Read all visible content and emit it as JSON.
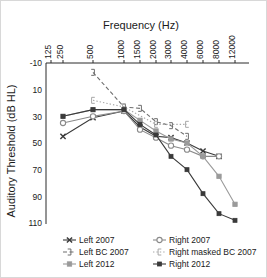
{
  "chart_data": {
    "type": "line",
    "title": "Frequency (Hz)",
    "xlabel": "Frequency (Hz)",
    "ylabel": "Auditory Threshold (dB HL)",
    "x_tick_labels": [
      "125",
      "250",
      "500",
      "1000",
      "1500",
      "2000",
      "3000",
      "4000",
      "6000",
      "8000",
      "12000"
    ],
    "x_values": [
      125,
      250,
      500,
      1000,
      1500,
      2000,
      3000,
      4000,
      6000,
      8000,
      12000
    ],
    "y_tick_labels": [
      "-10",
      "10",
      "30",
      "50",
      "70",
      "90",
      "110"
    ],
    "y_values": [
      -10,
      10,
      30,
      50,
      70,
      90,
      110
    ],
    "ylim": [
      -10,
      110
    ],
    "y_inverted": true,
    "grid": false,
    "legend_position": "bottom",
    "series": [
      {
        "name": "Left 2007",
        "marker": "x",
        "line_style": "solid",
        "color": "#3a3a3a",
        "x": [
          250,
          500,
          1000,
          1500,
          2000,
          3000,
          4000,
          6000,
          8000
        ],
        "values": [
          45,
          31,
          26,
          38,
          45,
          46,
          50,
          56,
          60
        ]
      },
      {
        "name": "Right 2007",
        "marker": "circle",
        "line_style": "solid",
        "color": "#8a8a8a",
        "x": [
          250,
          500,
          1000,
          1500,
          2000,
          3000,
          4000,
          6000,
          8000
        ],
        "values": [
          35,
          30,
          26,
          40,
          46,
          52,
          55,
          60,
          60
        ]
      },
      {
        "name": "Left BC 2007",
        "marker": "bracket-right",
        "line_style": "dashed",
        "color": "#6e6e6e",
        "x": [
          500,
          1000,
          1500,
          2000,
          3000,
          4000
        ],
        "values": [
          -3,
          23,
          24,
          34,
          37,
          45
        ]
      },
      {
        "name": "Right masked BC 2007",
        "marker": "bracket-left",
        "line_style": "dotted",
        "color": "#a8a8a8",
        "x": [
          500,
          1000,
          2000,
          4000
        ],
        "values": [
          18,
          23,
          36,
          36
        ]
      },
      {
        "name": "Left 2012",
        "marker": "square",
        "line_style": "solid",
        "color": "#9a9a9a",
        "x": [
          250,
          500,
          1000,
          1500,
          2000,
          3000,
          4000,
          6000,
          8000,
          12000
        ],
        "values": [
          30,
          25,
          25,
          33,
          41,
          47,
          50,
          60,
          75,
          96
        ]
      },
      {
        "name": "Right 2012",
        "marker": "square-filled",
        "line_style": "solid",
        "color": "#3a3a3a",
        "x": [
          250,
          500,
          1000,
          1500,
          2000,
          3000,
          4000,
          6000,
          8000,
          12000
        ],
        "values": [
          30,
          25,
          25,
          36,
          44,
          60,
          70,
          88,
          103,
          108
        ]
      }
    ]
  },
  "legend": {
    "entries": [
      {
        "label": "Left 2007"
      },
      {
        "label": "Right 2007"
      },
      {
        "label": "Left BC 2007"
      },
      {
        "label": "Right masked BC 2007"
      },
      {
        "label": "Left 2012"
      },
      {
        "label": "Right 2012"
      }
    ]
  }
}
